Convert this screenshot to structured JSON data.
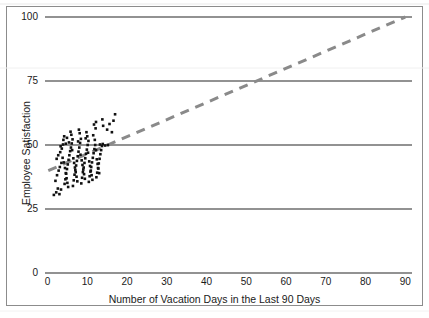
{
  "chart_data": {
    "type": "scatter",
    "title": "",
    "xlabel": "Number of Vacation Days in the Last 90 Days",
    "ylabel": "Employee Satisfaction",
    "xlim": [
      0,
      95
    ],
    "ylim": [
      0,
      100
    ],
    "xticks": [
      0,
      10,
      20,
      30,
      40,
      50,
      60,
      70,
      80,
      90
    ],
    "yticks": [
      0,
      25,
      50,
      75,
      100
    ],
    "grid": true,
    "grid_axis": "y",
    "legend": "none",
    "point_color": "#111111",
    "point_size": 2.6,
    "series": [
      {
        "name": "Employees",
        "points": [
          [
            1.6,
            30.5
          ],
          [
            2.2,
            31.5
          ],
          [
            2.6,
            33.0
          ],
          [
            3.0,
            30.8
          ],
          [
            3.4,
            32.6
          ],
          [
            2.0,
            36.0
          ],
          [
            2.4,
            38.2
          ],
          [
            2.8,
            40.0
          ],
          [
            3.1,
            41.4
          ],
          [
            3.5,
            43.0
          ],
          [
            2.3,
            44.6
          ],
          [
            2.7,
            46.0
          ],
          [
            3.2,
            47.2
          ],
          [
            3.6,
            48.6
          ],
          [
            3.9,
            50.2
          ],
          [
            4.0,
            52.0
          ],
          [
            4.2,
            53.4
          ],
          [
            3.8,
            45.0
          ],
          [
            4.1,
            43.2
          ],
          [
            4.4,
            41.0
          ],
          [
            4.6,
            39.0
          ],
          [
            4.8,
            37.0
          ],
          [
            5.0,
            35.2
          ],
          [
            5.2,
            33.6
          ],
          [
            4.3,
            34.8
          ],
          [
            4.5,
            36.6
          ],
          [
            4.7,
            38.8
          ],
          [
            4.9,
            40.6
          ],
          [
            5.1,
            42.4
          ],
          [
            5.3,
            44.2
          ],
          [
            5.5,
            46.0
          ],
          [
            5.7,
            47.6
          ],
          [
            5.9,
            49.0
          ],
          [
            6.1,
            50.6
          ],
          [
            6.3,
            52.2
          ],
          [
            6.0,
            54.0
          ],
          [
            5.8,
            55.2
          ],
          [
            6.5,
            44.8
          ],
          [
            6.7,
            43.0
          ],
          [
            6.9,
            41.2
          ],
          [
            7.1,
            39.4
          ],
          [
            7.3,
            37.6
          ],
          [
            7.5,
            35.8
          ],
          [
            6.4,
            34.0
          ],
          [
            6.6,
            36.2
          ],
          [
            6.8,
            38.4
          ],
          [
            7.0,
            40.2
          ],
          [
            7.2,
            42.0
          ],
          [
            7.4,
            43.8
          ],
          [
            7.6,
            45.6
          ],
          [
            7.8,
            47.4
          ],
          [
            8.0,
            49.0
          ],
          [
            8.2,
            50.8
          ],
          [
            8.4,
            52.4
          ],
          [
            8.1,
            54.6
          ],
          [
            7.9,
            56.0
          ],
          [
            8.6,
            44.0
          ],
          [
            8.8,
            42.2
          ],
          [
            9.0,
            40.4
          ],
          [
            9.2,
            38.6
          ],
          [
            9.4,
            36.8
          ],
          [
            8.5,
            35.0
          ],
          [
            8.7,
            37.2
          ],
          [
            8.9,
            39.4
          ],
          [
            9.1,
            41.2
          ],
          [
            9.3,
            43.0
          ],
          [
            9.5,
            44.8
          ],
          [
            9.7,
            46.6
          ],
          [
            9.9,
            48.2
          ],
          [
            10.1,
            50.0
          ],
          [
            10.3,
            51.6
          ],
          [
            10.0,
            53.4
          ],
          [
            9.8,
            55.0
          ],
          [
            10.5,
            43.6
          ],
          [
            10.7,
            41.8
          ],
          [
            10.9,
            40.0
          ],
          [
            11.1,
            38.2
          ],
          [
            11.3,
            36.4
          ],
          [
            10.4,
            35.6
          ],
          [
            10.6,
            37.8
          ],
          [
            10.8,
            39.6
          ],
          [
            11.0,
            41.4
          ],
          [
            11.2,
            43.2
          ],
          [
            11.4,
            45.0
          ],
          [
            11.6,
            46.8
          ],
          [
            11.8,
            48.4
          ],
          [
            12.0,
            50.0
          ],
          [
            12.2,
            48.0
          ],
          [
            11.9,
            52.0
          ],
          [
            11.5,
            53.8
          ],
          [
            12.4,
            44.4
          ],
          [
            12.6,
            42.6
          ],
          [
            12.8,
            40.8
          ],
          [
            13.0,
            39.0
          ],
          [
            12.3,
            37.4
          ],
          [
            12.5,
            39.2
          ],
          [
            12.7,
            41.0
          ],
          [
            12.9,
            42.8
          ],
          [
            13.1,
            44.6
          ],
          [
            13.3,
            46.4
          ],
          [
            13.5,
            48.0
          ],
          [
            13.7,
            49.6
          ],
          [
            12.1,
            56.5
          ],
          [
            11.7,
            58.0
          ],
          [
            13.2,
            50.2
          ],
          [
            5.4,
            51.0
          ],
          [
            4.9,
            52.8
          ],
          [
            6.2,
            48.0
          ],
          [
            7.7,
            51.4
          ],
          [
            8.3,
            46.2
          ],
          [
            9.6,
            52.6
          ],
          [
            10.2,
            47.0
          ],
          [
            13.9,
            50.4
          ],
          [
            14.5,
            49.8
          ],
          [
            15.2,
            50.0
          ],
          [
            14.0,
            57.5
          ],
          [
            15.0,
            56.0
          ],
          [
            16.2,
            55.0
          ],
          [
            16.6,
            59.5
          ],
          [
            17.0,
            62.0
          ],
          [
            15.6,
            58.2
          ],
          [
            13.8,
            60.0
          ],
          [
            12.2,
            59.0
          ],
          [
            3.3,
            49.5
          ],
          [
            4.6,
            50.5
          ]
        ]
      }
    ],
    "trendline": {
      "style": "dashed",
      "color": "#8a8a8a",
      "width": 3,
      "dash": "9 7",
      "x0": 0.2,
      "y0": 40.0,
      "x1": 90.0,
      "y1": 100.0
    }
  }
}
